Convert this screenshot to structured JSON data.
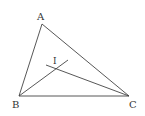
{
  "diagram": {
    "title": "",
    "stroke_color": "#444444",
    "points": {
      "A": {
        "label": "A",
        "x": 42,
        "y": 24
      },
      "B": {
        "label": "B",
        "x": 19,
        "y": 96
      },
      "C": {
        "label": "C",
        "x": 129,
        "y": 96
      },
      "I": {
        "label": "I",
        "x": 56,
        "y": 68
      }
    },
    "labels": {
      "A": "A",
      "B": "B",
      "C": "C",
      "I": "I"
    },
    "segments": [
      {
        "from": "A",
        "to": "B"
      },
      {
        "from": "A",
        "to": "C"
      },
      {
        "from": "B",
        "to": "C"
      },
      {
        "from": "B",
        "to": "bisector_B_end"
      },
      {
        "from": "C",
        "to": "bisector_C_end"
      }
    ]
  }
}
